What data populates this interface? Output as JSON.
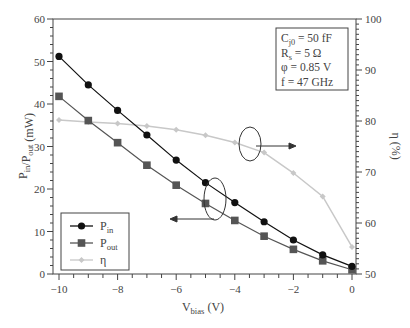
{
  "chart_data": {
    "type": "line",
    "title": "",
    "xlabel": "V_bias (V)",
    "xlabel_main": "V",
    "xlabel_sub": "bias",
    "xlabel_unit": " (V)",
    "ylabel": "P_in/P_out (mW)",
    "y2label": "η (%)",
    "xlim": [
      -10,
      0
    ],
    "ylim": [
      0,
      60
    ],
    "y2lim": [
      50,
      100
    ],
    "x_ticks": [
      -10,
      -8,
      -6,
      -4,
      -2,
      0
    ],
    "y_ticks": [
      0,
      10,
      20,
      30,
      40,
      50,
      60
    ],
    "y2_ticks": [
      50,
      60,
      70,
      80,
      90,
      100
    ],
    "x": [
      -10,
      -9,
      -8,
      -7,
      -6,
      -5,
      -4,
      -3,
      -2,
      -1,
      0
    ],
    "series": [
      {
        "name": "P_in",
        "axis": "left",
        "marker": "circle",
        "color": "#111111",
        "values": [
          51.2,
          44.5,
          38.5,
          32.7,
          26.8,
          21.5,
          16.8,
          12.3,
          8.0,
          4.5,
          1.8
        ]
      },
      {
        "name": "P_out",
        "axis": "left",
        "marker": "square",
        "color": "#555555",
        "values": [
          41.8,
          36.1,
          30.9,
          25.6,
          20.9,
          16.6,
          12.6,
          8.9,
          5.8,
          3.1,
          1.0
        ]
      },
      {
        "name": "η",
        "axis": "right",
        "marker": "diamond",
        "color": "#c8c8c8",
        "values": [
          80.2,
          79.8,
          79.5,
          79.0,
          78.3,
          77.2,
          75.8,
          73.8,
          69.8,
          65.2,
          55.3
        ]
      }
    ],
    "legend": {
      "position": "lower-left",
      "entries": [
        {
          "main": "P",
          "sub": "in"
        },
        {
          "main": "P",
          "sub": "out"
        },
        {
          "main": "η",
          "sub": ""
        }
      ]
    },
    "annotations": {
      "params": [
        {
          "main": "C",
          "sub": "j0",
          "rest": " = 50 fF"
        },
        {
          "main": "R",
          "sub": "s",
          "rest": " = 5 Ω"
        },
        {
          "main": "φ",
          "sub": "",
          "rest": " = 0.85 V"
        },
        {
          "main": "f",
          "sub": "",
          "rest": " = 47 GHz"
        }
      ],
      "arrows": [
        "P_in/P_out curves → left axis",
        "η curve → right axis"
      ]
    },
    "grid": false
  }
}
